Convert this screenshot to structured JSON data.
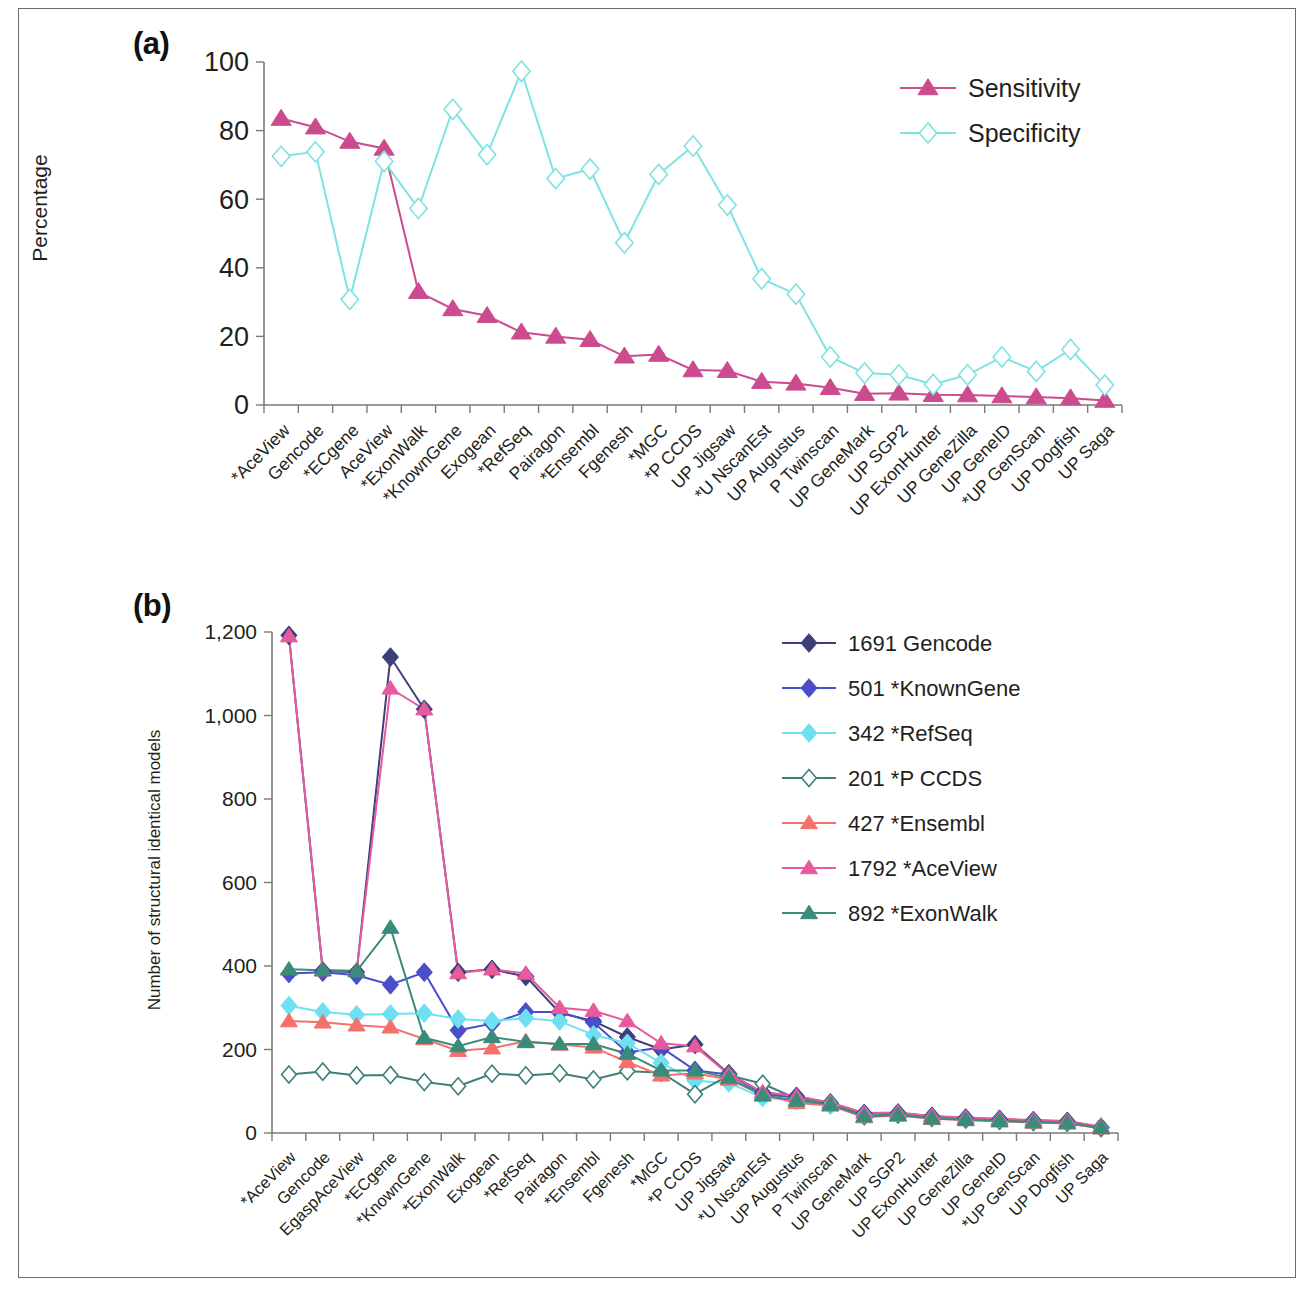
{
  "figure": {
    "panel_a_tag": "(a)",
    "panel_b_tag": "(b)"
  },
  "chart_data": [
    {
      "type": "line",
      "panel": "(a)",
      "title": "",
      "xlabel": "",
      "ylabel": "Percentage",
      "ylim": [
        0,
        100
      ],
      "yticks": [
        0,
        20,
        40,
        60,
        80,
        100
      ],
      "grid": false,
      "legend_position": "top-right",
      "categories": [
        "*AceView",
        "Gencode",
        "*ECgene",
        "AceView",
        "*ExonWalk",
        "*KnownGene",
        "Exogean",
        "*RefSeq",
        "Pairagon",
        "*Ensembl",
        "Fgenesh",
        "*MGC",
        "*P CCDS",
        "UP Jigsaw",
        "*U NscanEst",
        "UP Augustus",
        "P Twinscan",
        "UP GeneMark",
        "UP SGP2",
        "UP ExonHunter",
        "UP GeneZilla",
        "UP GeneID",
        "*UP GenScan",
        "UP Dogfish",
        "UP Saga"
      ],
      "series": [
        {
          "name": "Sensitivity",
          "color": "#cc4b8f",
          "marker": "triangle",
          "values": [
            83.5,
            81.0,
            76.8,
            74.8,
            33.0,
            28.0,
            26.0,
            21.2,
            20.0,
            19.0,
            14.2,
            14.7,
            10.2,
            10.0,
            6.8,
            6.3,
            5.0,
            3.3,
            3.4,
            3.0,
            2.9,
            2.6,
            2.3,
            2.0,
            1.3
          ]
        },
        {
          "name": "Specificity",
          "color": "#7fe3e3",
          "marker": "diamond-open",
          "values": [
            72.5,
            73.8,
            30.8,
            71.0,
            57.3,
            86.2,
            73.0,
            97.3,
            66.0,
            68.8,
            47.3,
            67.2,
            75.5,
            58.3,
            36.8,
            32.3,
            14.0,
            9.3,
            8.8,
            6.0,
            8.8,
            14.0,
            9.8,
            16.2,
            5.8
          ]
        }
      ]
    },
    {
      "type": "line",
      "panel": "(b)",
      "title": "",
      "xlabel": "",
      "ylabel": "Number of structural identical models",
      "ylim": [
        0,
        1200
      ],
      "yticks": [
        0,
        200,
        400,
        600,
        800,
        1000,
        1200
      ],
      "ytick_labels": [
        "0",
        "200",
        "400",
        "600",
        "800",
        "1,000",
        "1,200"
      ],
      "grid": false,
      "legend_position": "top-right",
      "categories": [
        "*AceView",
        "Gencode",
        "EgaspAceView",
        "*ECgene",
        "*KnownGene",
        "*ExonWalk",
        "Exogean",
        "*RefSeq",
        "Pairagon",
        "*Ensembl",
        "Fgenesh",
        "*MGC",
        "*P CCDS",
        "UP Jigsaw",
        "*U NscanEst",
        "UP Augustus",
        "P Twinscan",
        "UP GeneMark",
        "UP SGP2",
        "UP ExonHunter",
        "UP GeneZilla",
        "UP GeneID",
        "*UP GenScan",
        "UP Dogfish",
        "UP Saga"
      ],
      "series": [
        {
          "name": "1691 Gencode",
          "color": "#3b3f7a",
          "marker": "diamond",
          "values": [
            1192,
            388,
            385,
            1140,
            1015,
            385,
            392,
            375,
            288,
            268,
            230,
            200,
            212,
            142,
            97,
            88,
            72,
            47,
            48,
            40,
            36,
            33,
            30,
            28,
            14
          ]
        },
        {
          "name": "501 *KnownGene",
          "color": "#4a4ecb",
          "marker": "diamond",
          "values": [
            382,
            385,
            378,
            355,
            385,
            246,
            262,
            290,
            290,
            265,
            193,
            205,
            150,
            140,
            93,
            85,
            70,
            45,
            46,
            38,
            35,
            31,
            28,
            26,
            13
          ]
        },
        {
          "name": "342 *RefSeq",
          "color": "#6fe0f2",
          "marker": "diamond",
          "values": [
            305,
            290,
            283,
            285,
            287,
            273,
            268,
            275,
            268,
            235,
            215,
            168,
            125,
            120,
            85,
            78,
            66,
            42,
            44,
            36,
            32,
            29,
            26,
            24,
            12
          ]
        },
        {
          "name": "201 *P CCDS",
          "color": "#3f7f7a",
          "marker": "diamond-open",
          "values": [
            140,
            147,
            138,
            139,
            122,
            112,
            142,
            138,
            143,
            128,
            148,
            145,
            93,
            138,
            118,
            82,
            72,
            40,
            45,
            37,
            33,
            30,
            27,
            25,
            12
          ]
        },
        {
          "name": "427 *Ensembl",
          "color": "#f4716b",
          "marker": "triangle",
          "values": [
            268,
            265,
            258,
            253,
            225,
            197,
            203,
            220,
            212,
            205,
            170,
            138,
            143,
            128,
            92,
            72,
            66,
            38,
            42,
            34,
            31,
            28,
            25,
            23,
            11
          ]
        },
        {
          "name": "1792 *AceView",
          "color": "#e85a9e",
          "marker": "triangle",
          "values": [
            1190,
            390,
            388,
            1065,
            1015,
            383,
            392,
            382,
            300,
            293,
            268,
            215,
            208,
            140,
            98,
            88,
            73,
            48,
            49,
            41,
            37,
            34,
            31,
            29,
            15
          ]
        },
        {
          "name": "892 *ExonWalk",
          "color": "#3a8c7a",
          "marker": "triangle",
          "values": [
            392,
            390,
            388,
            492,
            228,
            208,
            230,
            218,
            213,
            213,
            190,
            150,
            150,
            132,
            90,
            78,
            68,
            40,
            43,
            35,
            32,
            29,
            26,
            24,
            12
          ]
        }
      ]
    }
  ]
}
